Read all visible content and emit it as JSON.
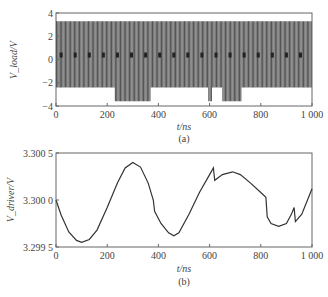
{
  "chart_data": [
    {
      "id": "a",
      "type": "line",
      "caption": "(a)",
      "xlabel": "t/ns",
      "ylabel": "V_load/V",
      "xlim": [
        0,
        1000
      ],
      "ylim": [
        -4,
        4
      ],
      "xticks": [
        "0",
        "200",
        "400",
        "600",
        "800",
        "1 000"
      ],
      "yticks": [
        "4",
        "2",
        "0",
        "-2",
        "-4"
      ],
      "grid": false,
      "description": "Dense switching pulse train between approx +3.3 V and -2.4 V with marks near 0 V; deeper negative excursions to approx -3.6 V during ~230-370 ns, ~595-610 ns and ~650-725 ns",
      "high_level": 3.3,
      "low_level": -2.4,
      "deep_low_level": -3.6,
      "deep_low_intervals": [
        [
          230,
          370
        ],
        [
          595,
          610
        ],
        [
          650,
          725
        ]
      ],
      "pulse_period_ns": 10
    },
    {
      "id": "b",
      "type": "line",
      "caption": "(b)",
      "xlabel": "t/ns",
      "ylabel": "V_driver/V",
      "xlim": [
        0,
        1000
      ],
      "ylim": [
        3.2995,
        3.3005
      ],
      "xticks": [
        "0",
        "200",
        "400",
        "600",
        "800",
        "1 000"
      ],
      "yticks": [
        "3.300 5",
        "3.300 0",
        "3.299 5"
      ],
      "grid": false,
      "x": [
        0,
        20,
        50,
        80,
        100,
        130,
        160,
        200,
        240,
        270,
        300,
        330,
        360,
        380,
        385,
        410,
        440,
        460,
        480,
        520,
        560,
        600,
        615,
        620,
        650,
        690,
        720,
        760,
        800,
        820,
        825,
        840,
        870,
        900,
        920,
        930,
        935,
        960,
        1000
      ],
      "y": [
        3.3,
        3.29984,
        3.29966,
        3.29957,
        3.29955,
        3.29958,
        3.29968,
        3.29992,
        3.30018,
        3.30034,
        3.3004,
        3.30035,
        3.30018,
        3.3,
        3.29988,
        3.29975,
        3.29965,
        3.29962,
        3.29965,
        3.29985,
        3.30008,
        3.30027,
        3.30034,
        3.30021,
        3.30027,
        3.3003,
        3.30027,
        3.30018,
        3.30008,
        3.30003,
        3.29982,
        3.29975,
        3.29972,
        3.29975,
        3.29985,
        3.29992,
        3.29977,
        3.29985,
        3.30012
      ]
    }
  ]
}
